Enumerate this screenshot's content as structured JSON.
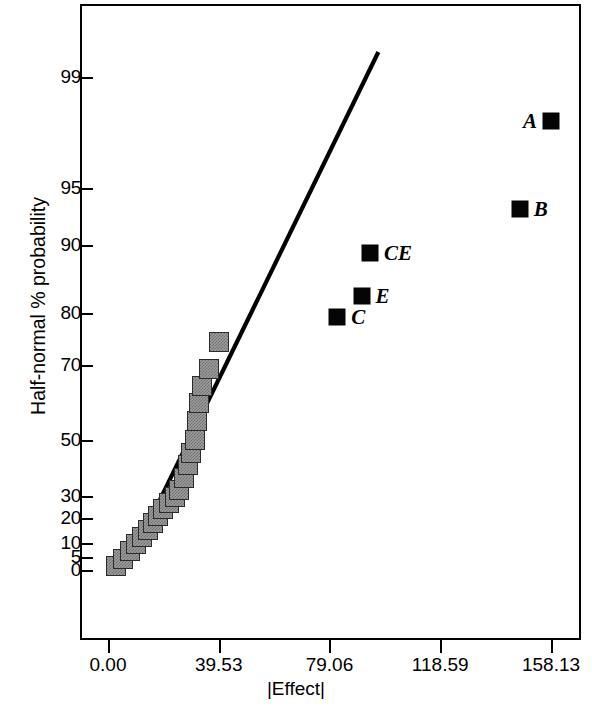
{
  "chart_data": {
    "type": "scatter",
    "title": "",
    "xlabel": "|Effect|",
    "ylabel": "Half-normal % probability",
    "grid": false,
    "legend": "none",
    "xlim": [
      0.0,
      172.0
    ],
    "xticks": [
      "0.00",
      "39.53",
      "79.06",
      "118.59",
      "158.13"
    ],
    "xtick_values": [
      0.0,
      39.53,
      79.06,
      118.59,
      158.13
    ],
    "yscale": "half-normal probability",
    "yticks": [
      "0",
      "5",
      "10",
      "20",
      "30",
      "50",
      "70",
      "80",
      "90",
      "95",
      "99"
    ],
    "ytick_values": [
      0,
      5,
      10,
      20,
      30,
      50,
      70,
      80,
      90,
      95,
      99
    ],
    "reference_line": {
      "label": "",
      "x_start": 7.0,
      "y_start": 1.5,
      "x_end": 96.5,
      "y_end": 99.9
    },
    "series": [
      {
        "name": "unlabeled effects",
        "marker": "grey-square",
        "points": [
          {
            "x": 3.0,
            "y": 1.4
          },
          {
            "x": 5.4,
            "y": 4.2
          },
          {
            "x": 8.0,
            "y": 7.0
          },
          {
            "x": 10.0,
            "y": 9.8
          },
          {
            "x": 12.2,
            "y": 12.6
          },
          {
            "x": 14.1,
            "y": 15.4
          },
          {
            "x": 16.2,
            "y": 18.2
          },
          {
            "x": 18.0,
            "y": 21.1
          },
          {
            "x": 19.6,
            "y": 23.9
          },
          {
            "x": 21.8,
            "y": 26.7
          },
          {
            "x": 23.8,
            "y": 29.5
          },
          {
            "x": 25.5,
            "y": 32.3
          },
          {
            "x": 27.2,
            "y": 36.5
          },
          {
            "x": 28.5,
            "y": 41.0
          },
          {
            "x": 29.8,
            "y": 45.5
          },
          {
            "x": 30.9,
            "y": 50.0
          },
          {
            "x": 31.8,
            "y": 55.0
          },
          {
            "x": 32.6,
            "y": 60.0
          },
          {
            "x": 33.6,
            "y": 64.5
          },
          {
            "x": 36.0,
            "y": 69.0
          },
          {
            "x": 39.8,
            "y": 74.5
          }
        ]
      },
      {
        "name": "significant effects",
        "marker": "black-square",
        "points": [
          {
            "x": 81.8,
            "y": 79.2,
            "label": "C",
            "label_side": "right"
          },
          {
            "x": 90.5,
            "y": 82.5,
            "label": "E",
            "label_side": "right"
          },
          {
            "x": 93.5,
            "y": 88.8,
            "label": "CE",
            "label_side": "right"
          },
          {
            "x": 147.0,
            "y": 93.2,
            "label": "B",
            "label_side": "right"
          },
          {
            "x": 158.1,
            "y": 97.4,
            "label": "A",
            "label_side": "left"
          }
        ]
      }
    ]
  }
}
